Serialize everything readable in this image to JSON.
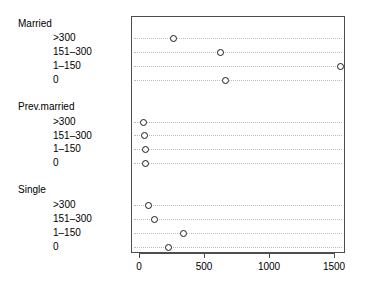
{
  "chart_data": {
    "type": "scatter",
    "title": "",
    "xlabel": "",
    "ylabel": "",
    "xlim": [
      0,
      1640
    ],
    "xticks": [
      0,
      500,
      1000,
      1500
    ],
    "xtick_labels": [
      "0",
      "500",
      "1000",
      "1500"
    ],
    "grid": true,
    "grid_style": "dotted-horizontal",
    "legend": "none",
    "marker": "open-circle",
    "groups": [
      {
        "name": "Married",
        "categories": [
          ">300",
          "151–300",
          "1–150",
          "0"
        ],
        "values": [
          254,
          615,
          1538,
          654
        ]
      },
      {
        "name": "Prev.married",
        "categories": [
          ">300",
          "151–300",
          "1–150",
          "0"
        ],
        "values": [
          25,
          32,
          38,
          35
        ]
      },
      {
        "name": "Single",
        "categories": [
          ">300",
          "151–300",
          "1–150",
          "0"
        ],
        "values": [
          62,
          108,
          331,
          215
        ]
      }
    ]
  },
  "labels": {
    "group_married": "Married",
    "group_prev_married": "Prev.married",
    "group_single": "Single",
    "level_over_300": ">300",
    "level_151_300": "151–300",
    "level_1_150": "1–150",
    "level_0": "0"
  },
  "axis": {
    "tick_0": "0",
    "tick_500": "500",
    "tick_1000": "1000",
    "tick_1500": "1500"
  },
  "colors": {
    "frame": "#4d4d4d",
    "gridline": "#bdbdbd",
    "marker": "#1a1a1a",
    "text": "#000000",
    "background": "#ffffff"
  }
}
